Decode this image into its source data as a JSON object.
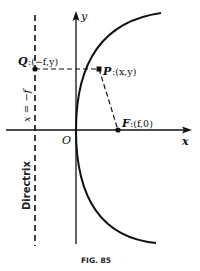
{
  "figure": {
    "caption": "FIG. 85",
    "colors": {
      "ink": "#111111",
      "background": "#ffffff"
    },
    "axes": {
      "x_label": "x",
      "y_label": "y",
      "origin_label": "O"
    },
    "directrix": {
      "equation_label": "x = −f",
      "name_label": "Directrix"
    },
    "points": {
      "Q": {
        "name": "Q",
        "coords": ":(−f,y)"
      },
      "P": {
        "name": "P",
        "coords": ":(x,y)"
      },
      "F": {
        "name": "F",
        "coords": ":(f,0)"
      }
    },
    "curve": "parabola y² = 4fx opening to the right, vertex at O, focus F"
  }
}
